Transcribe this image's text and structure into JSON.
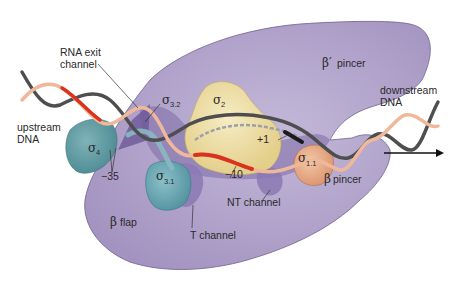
{
  "figure": {
    "colors": {
      "background": "#ffffff",
      "core_enzyme": "#a99cc4",
      "core_enzyme_dark": "#7d6aa6",
      "sigma_2": "#eedfa6",
      "sigma_4": "#5e9aa2",
      "sigma_3_1": "#6aa5b3",
      "sigma_1_1": "#e7ac86",
      "dna_template": "#555555",
      "dna_nontemplate": "#f0b89a",
      "promoter_element": "#d9321e",
      "transcription_start": "#222222",
      "arrow": "#111111"
    },
    "labels": {
      "rna_exit_line1": "RNA exit",
      "rna_exit_line2": "channel",
      "upstream_line1": "upstream",
      "upstream_line2": "DNA",
      "downstream_line1": "downstream",
      "downstream_line2": "DNA",
      "beta_prime_pincer_symbol": "β′",
      "beta_prime_pincer_text": "pincer",
      "beta_pincer_symbol": "β",
      "beta_pincer_text": "pincer",
      "beta_flap_symbol": "β",
      "beta_flap_text": "flap",
      "t_channel": "T channel",
      "nt_channel": "NT channel",
      "minus_35": "−35",
      "minus_10": "−10",
      "plus_1": "+1"
    },
    "sigma_domains": {
      "sigma_symbol": "σ",
      "s2_sub": "2",
      "s32_sub": "3.2",
      "s31_sub": "3.1",
      "s4_sub": "4",
      "s11_sub": "1.1"
    }
  }
}
